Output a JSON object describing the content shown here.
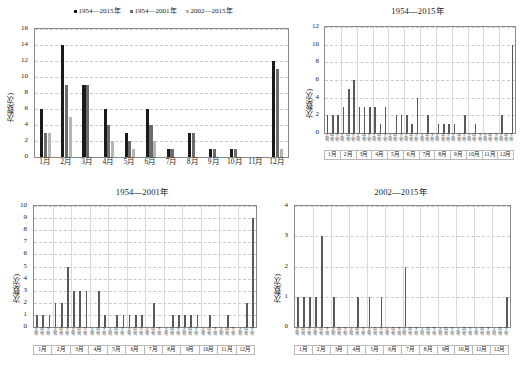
{
  "figure": {
    "ylabel": "次数(次)",
    "month_labels": [
      "1月",
      "2月",
      "3月",
      "4月",
      "5月",
      "6月",
      "7月",
      "8月",
      "9月",
      "10月",
      "11月",
      "12月"
    ],
    "decade_labels": [
      "上旬",
      "中旬",
      "下旬"
    ],
    "colors": {
      "series1": "#1a1a1a",
      "series2": "#6b6b6b",
      "series3": "#b5b5b5",
      "bar": "#595959",
      "grid": "#c9c9c9",
      "axis": "#8a8a8a"
    }
  },
  "chart_data": [
    {
      "id": "monthly-comparison",
      "type": "bar",
      "title": "",
      "xlabel": "",
      "ylabel": "次数(次)",
      "ylim": [
        0,
        16
      ],
      "yticks": [
        0,
        2,
        4,
        6,
        8,
        10,
        12,
        14,
        16
      ],
      "grid": true,
      "legend_position": "top",
      "categories": [
        "1月",
        "2月",
        "3月",
        "4月",
        "5月",
        "6月",
        "7月",
        "8月",
        "9月",
        "10月",
        "11月",
        "12月"
      ],
      "series": [
        {
          "name": "1954—2015年",
          "color": "#1a1a1a",
          "values": [
            6,
            14,
            9,
            6,
            3,
            6,
            1,
            3,
            1,
            1,
            0,
            12
          ]
        },
        {
          "name": "1954—2001年",
          "color": "#6b6b6b",
          "values": [
            3,
            9,
            9,
            4,
            2,
            4,
            1,
            3,
            1,
            1,
            0,
            11
          ]
        },
        {
          "name": "2002—2015年",
          "color": "#b5b5b5",
          "values": [
            3,
            5,
            0,
            2,
            1,
            2,
            0,
            0,
            0,
            0,
            0,
            1
          ]
        }
      ]
    },
    {
      "id": "dekad-1954-2015",
      "type": "bar",
      "title": "1954—2015年",
      "xlabel": "",
      "ylabel": "次数(次)",
      "ylim": [
        0,
        12
      ],
      "yticks": [
        0,
        2,
        4,
        6,
        8,
        10,
        12
      ],
      "grid": true,
      "categories": [
        "1月上旬",
        "1月中旬",
        "1月下旬",
        "2月上旬",
        "2月中旬",
        "2月下旬",
        "3月上旬",
        "3月中旬",
        "3月下旬",
        "4月上旬",
        "4月中旬",
        "4月下旬",
        "5月上旬",
        "5月中旬",
        "5月下旬",
        "6月上旬",
        "6月中旬",
        "6月下旬",
        "7月上旬",
        "7月中旬",
        "7月下旬",
        "8月上旬",
        "8月中旬",
        "8月下旬",
        "9月上旬",
        "9月中旬",
        "9月下旬",
        "10月上旬",
        "10月中旬",
        "10月下旬",
        "11月上旬",
        "11月中旬",
        "11月下旬",
        "12月上旬",
        "12月中旬",
        "12月下旬"
      ],
      "values": [
        2,
        2,
        2,
        3,
        5,
        6,
        3,
        3,
        3,
        3,
        1,
        3,
        0,
        2,
        2,
        2,
        1,
        4,
        0,
        2,
        0,
        1,
        1,
        1,
        1,
        0,
        2,
        0,
        1,
        0,
        0,
        0,
        0,
        2,
        0,
        10
      ]
    },
    {
      "id": "dekad-1954-2001",
      "type": "bar",
      "title": "1954—2001年",
      "xlabel": "",
      "ylabel": "次数(次)",
      "ylim": [
        0,
        10
      ],
      "yticks": [
        0,
        1,
        2,
        3,
        4,
        5,
        6,
        7,
        8,
        9,
        10
      ],
      "grid": true,
      "categories": [
        "1月上旬",
        "1月中旬",
        "1月下旬",
        "2月上旬",
        "2月中旬",
        "2月下旬",
        "3月上旬",
        "3月中旬",
        "3月下旬",
        "4月上旬",
        "4月中旬",
        "4月下旬",
        "5月上旬",
        "5月中旬",
        "5月下旬",
        "6月上旬",
        "6月中旬",
        "6月下旬",
        "7月上旬",
        "7月中旬",
        "7月下旬",
        "8月上旬",
        "8月中旬",
        "8月下旬",
        "9月上旬",
        "9月中旬",
        "9月下旬",
        "10月上旬",
        "10月中旬",
        "10月下旬",
        "11月上旬",
        "11月中旬",
        "11月下旬",
        "12月上旬",
        "12月中旬",
        "12月下旬"
      ],
      "values": [
        1,
        1,
        1,
        2,
        2,
        5,
        3,
        3,
        3,
        0,
        3,
        1,
        0,
        1,
        1,
        1,
        1,
        1,
        0,
        2,
        0,
        0,
        1,
        1,
        1,
        1,
        1,
        0,
        1,
        0,
        0,
        1,
        0,
        0,
        2,
        9
      ]
    },
    {
      "id": "dekad-2002-2015",
      "type": "bar",
      "title": "2002—2015年",
      "xlabel": "",
      "ylabel": "次数(次)",
      "ylim": [
        0,
        4
      ],
      "yticks": [
        0,
        1,
        2,
        3,
        4
      ],
      "grid": true,
      "categories": [
        "1月上旬",
        "1月中旬",
        "1月下旬",
        "2月上旬",
        "2月中旬",
        "2月下旬",
        "3月上旬",
        "3月中旬",
        "3月下旬",
        "4月上旬",
        "4月中旬",
        "4月下旬",
        "5月上旬",
        "5月中旬",
        "5月下旬",
        "6月上旬",
        "6月中旬",
        "6月下旬",
        "7月上旬",
        "7月中旬",
        "7月下旬",
        "8月上旬",
        "8月中旬",
        "8月下旬",
        "9月上旬",
        "9月中旬",
        "9月下旬",
        "10月上旬",
        "10月中旬",
        "10月下旬",
        "11月上旬",
        "11月中旬",
        "11月下旬",
        "12月上旬",
        "12月中旬",
        "12月下旬"
      ],
      "values": [
        1,
        1,
        1,
        1,
        3,
        0,
        1,
        0,
        0,
        0,
        1,
        0,
        1,
        0,
        1,
        0,
        0,
        0,
        2,
        0,
        0,
        0,
        0,
        0,
        0,
        0,
        0,
        0,
        0,
        0,
        0,
        0,
        0,
        0,
        0,
        1
      ]
    }
  ]
}
